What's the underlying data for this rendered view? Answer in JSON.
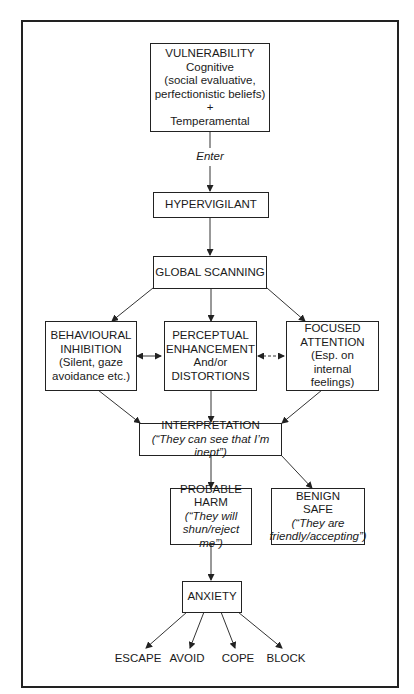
{
  "diagram": {
    "nodes": {
      "vulnerability": {
        "title": "VULNERABILITY",
        "line1": "Cognitive",
        "line2": "(social evaluative,",
        "line3": "perfectionistic beliefs)",
        "line4": "+",
        "line5": "Temperamental"
      },
      "enter_label": "Enter",
      "hypervigilant": {
        "title": "HYPERVIGILANT"
      },
      "global_scanning": {
        "title": "GLOBAL SCANNING"
      },
      "behavioural_inhibition": {
        "line1": "BEHAVIOURAL",
        "line2": "INHIBITION",
        "line3": "(Silent, gaze",
        "line4": "avoidance etc.)"
      },
      "perceptual_enhancement": {
        "line1": "PERCEPTUAL",
        "line2": "ENHANCEMENT",
        "line3": "And/or",
        "line4": "DISTORTIONS"
      },
      "focused_attention": {
        "line1": "FOCUSED",
        "line2": "ATTENTION",
        "line3": "(Esp. on",
        "line4": "internal",
        "line5": "feelings)"
      },
      "interpretation": {
        "title": "INTERPRETATION",
        "quote": "(“They can see that I’m inept”)"
      },
      "probable_harm": {
        "line1": "PROBABLE",
        "line2": "HARM",
        "line3": "(“They will",
        "line4": "shun/reject me”)"
      },
      "benign_safe": {
        "line1": "BENIGN",
        "line2": "SAFE",
        "line3": "(“They are",
        "line4": "friendly/accepting”)"
      },
      "anxiety": {
        "title": "ANXIETY"
      },
      "outcomes": [
        "ESCAPE",
        "AVOID",
        "COPE",
        "BLOCK"
      ]
    },
    "edges": [
      {
        "from": "vulnerability",
        "to": "hypervigilant",
        "label": "Enter"
      },
      {
        "from": "hypervigilant",
        "to": "global_scanning"
      },
      {
        "from": "global_scanning",
        "to": "behavioural_inhibition"
      },
      {
        "from": "global_scanning",
        "to": "perceptual_enhancement"
      },
      {
        "from": "global_scanning",
        "to": "focused_attention"
      },
      {
        "from": "behavioural_inhibition",
        "to": "perceptual_enhancement",
        "style": "bidirectional"
      },
      {
        "from": "perceptual_enhancement",
        "to": "focused_attention",
        "style": "bidirectional-dashed"
      },
      {
        "from": "behavioural_inhibition",
        "to": "interpretation"
      },
      {
        "from": "perceptual_enhancement",
        "to": "interpretation"
      },
      {
        "from": "focused_attention",
        "to": "interpretation"
      },
      {
        "from": "interpretation",
        "to": "probable_harm"
      },
      {
        "from": "interpretation",
        "to": "benign_safe"
      },
      {
        "from": "probable_harm",
        "to": "anxiety"
      },
      {
        "from": "anxiety",
        "to": "ESCAPE"
      },
      {
        "from": "anxiety",
        "to": "AVOID"
      },
      {
        "from": "anxiety",
        "to": "COPE"
      },
      {
        "from": "anxiety",
        "to": "BLOCK"
      }
    ]
  }
}
